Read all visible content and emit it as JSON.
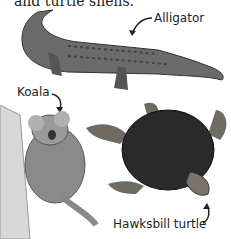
{
  "page": {
    "intro_text": "and turtle shells."
  },
  "labels": {
    "alligator": "Alligator",
    "koala": "Koala",
    "turtle": "Hawksbill turtle"
  },
  "colors": {
    "background": "#ffffff",
    "text": "#222222",
    "alligator_body": "#6b6b6b",
    "turtle_shell": "#2a2a2a",
    "koala_fur": "#8a8a8a"
  }
}
